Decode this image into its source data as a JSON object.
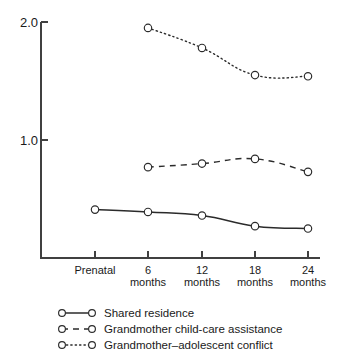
{
  "chart_data": {
    "type": "line",
    "title": "",
    "subtitle": "",
    "xlabel": "",
    "ylabel": "",
    "categories": [
      "Prenatal",
      "6 months",
      "12 months",
      "18 months",
      "24 months"
    ],
    "category_lines": [
      [
        "Prenatal",
        ""
      ],
      [
        "6",
        "months"
      ],
      [
        "12",
        "months"
      ],
      [
        "18",
        "months"
      ],
      [
        "24",
        "months"
      ]
    ],
    "ylim": [
      0,
      2.12
    ],
    "yticks": [
      2.0,
      1.0
    ],
    "ytick_labels": [
      "2.0",
      "1.0"
    ],
    "grid": false,
    "legend_position": "below",
    "series": [
      {
        "name": "Shared residence",
        "style": "solid",
        "marker": "open-circle",
        "color": "#2b2b2b",
        "x": [
          "Prenatal",
          "6 months",
          "12 months",
          "18 months",
          "24 months"
        ],
        "values": [
          0.41,
          0.39,
          0.36,
          0.27,
          0.25
        ]
      },
      {
        "name": "Grandmother child-care assistance",
        "style": "dashed",
        "marker": "open-circle",
        "color": "#2b2b2b",
        "x": [
          "6 months",
          "12 months",
          "18 months",
          "24 months"
        ],
        "values": [
          0.77,
          0.8,
          0.84,
          0.73
        ]
      },
      {
        "name": "Grandmother–adolescent conflict",
        "style": "dotted",
        "marker": "open-circle",
        "color": "#2b2b2b",
        "x": [
          "6 months",
          "12 months",
          "18 months",
          "24 months"
        ],
        "values": [
          1.95,
          1.78,
          1.55,
          1.54
        ]
      }
    ]
  },
  "axis": {
    "ytick_0": "2.0",
    "ytick_1": "1.0"
  },
  "xaxis": {
    "t0_line1": "Prenatal",
    "t1_line1": "6",
    "t1_line2": "months",
    "t2_line1": "12",
    "t2_line2": "months",
    "t3_line1": "18",
    "t3_line2": "months",
    "t4_line1": "24",
    "t4_line2": "months"
  },
  "legend": {
    "items": [
      {
        "label": "Shared residence",
        "style": "solid"
      },
      {
        "label": "Grandmother child-care assistance",
        "style": "dashed"
      },
      {
        "label": "Grandmother–adolescent conflict",
        "style": "dotted"
      }
    ]
  }
}
